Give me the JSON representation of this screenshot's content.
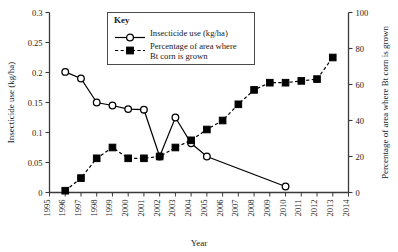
{
  "chart_data": {
    "type": "line",
    "title": "",
    "xlabel": "Year",
    "ylabel": "Insecticide use (kg/ha)",
    "y2label": "Percentage of area where Bt corn is grown",
    "xlim": [
      1995,
      2014
    ],
    "ylim": [
      0,
      0.3
    ],
    "y2lim": [
      0,
      100
    ],
    "grid": false,
    "legend_position": "top-center",
    "legend_title": "Key",
    "x_ticks": [
      1995,
      1996,
      1997,
      1998,
      1999,
      2000,
      2001,
      2002,
      2003,
      2004,
      2005,
      2006,
      2007,
      2008,
      2009,
      2010,
      2011,
      2012,
      2013,
      2014
    ],
    "y_ticks": [
      0,
      0.05,
      0.1,
      0.15,
      0.2,
      0.25,
      0.3
    ],
    "y_tick_labels": [
      "0",
      "0.05",
      "0.1",
      "0.15",
      "0.2",
      "0.25",
      "0.3"
    ],
    "y2_ticks": [
      0,
      20,
      40,
      60,
      80,
      100
    ],
    "y2_tick_labels": [
      "0",
      "20",
      "40",
      "60",
      "80",
      "100"
    ],
    "series": [
      {
        "name": "Insecticide use (kg/ha)",
        "axis": "left",
        "marker": "open-circle",
        "linestyle": "solid",
        "x": [
          1996,
          1997,
          1998,
          1999,
          2000,
          2001,
          2002,
          2003,
          2004,
          2005,
          2010
        ],
        "values": [
          0.201,
          0.19,
          0.15,
          0.145,
          0.139,
          0.138,
          0.06,
          0.125,
          0.082,
          0.06,
          0.01
        ]
      },
      {
        "name": "Percentage of area where Bt corn is grown",
        "axis": "right",
        "marker": "filled-square",
        "linestyle": "dashed",
        "x": [
          1996,
          1997,
          1998,
          1999,
          2000,
          2001,
          2002,
          2003,
          2004,
          2005,
          2006,
          2007,
          2008,
          2009,
          2010,
          2011,
          2012,
          2013
        ],
        "values": [
          1,
          8,
          19,
          25,
          19,
          19,
          20,
          25,
          29,
          35,
          40,
          49,
          57,
          61,
          61,
          62,
          63,
          75
        ]
      }
    ]
  },
  "legend": {
    "title": "Key",
    "entries": [
      {
        "label": "Insecticide use (kg/ha)",
        "marker": "open-circle",
        "linestyle": "solid"
      },
      {
        "label": "Percentage of area where",
        "label2": "Bt corn is grown",
        "marker": "filled-square",
        "linestyle": "dashed"
      }
    ]
  },
  "axes": {
    "x_title": "Year",
    "y_title": "Insecticide use (kg/ha)",
    "y2_title": "Percentage of area where Bt corn is grown"
  },
  "colors": {
    "line": "#000000",
    "axis": "#3a3a3a",
    "background": "#ffffff",
    "legend_border": "#4a4a4a"
  }
}
